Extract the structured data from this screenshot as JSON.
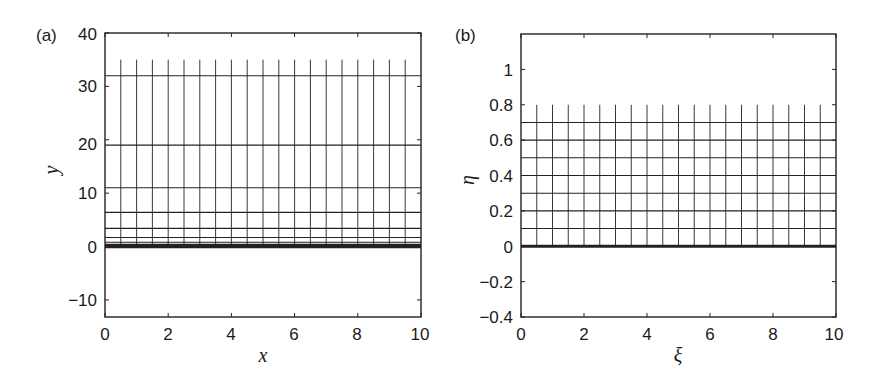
{
  "chart_data": [
    {
      "type": "line",
      "panel_label": "(a)",
      "title": "",
      "xlabel": "x",
      "ylabel": "y",
      "xlim": [
        0,
        10
      ],
      "ylim": [
        -13.2,
        40
      ],
      "xticks": [
        "0",
        "2",
        "4",
        "6",
        "8",
        "10"
      ],
      "yticks": [
        "-10",
        "0",
        "10",
        "20",
        "30",
        "40"
      ],
      "grid": false,
      "description": "Physical-plane mesh: horizontal grid lines clustered near y=0 (geometric stretching), vertical lines at x=0.5..9.5",
      "horizontal_lines_y": [
        0,
        0.4,
        0.8,
        1.7,
        3.4,
        6.4,
        11,
        19,
        32
      ],
      "thick_line_y": 0,
      "vertical_lines_x": [
        0.5,
        1.0,
        1.5,
        2.0,
        2.5,
        3.0,
        3.5,
        4.0,
        4.5,
        5.0,
        5.5,
        6.0,
        6.5,
        7.0,
        7.5,
        8.0,
        8.5,
        9.0,
        9.5
      ],
      "vertical_lines_y_range": [
        0,
        35
      ]
    },
    {
      "type": "line",
      "panel_label": "(b)",
      "title": "",
      "xlabel": "ξ",
      "ylabel": "η",
      "xlim": [
        0,
        10
      ],
      "ylim": [
        -0.4,
        1.2
      ],
      "xticks": [
        "0",
        "2",
        "4",
        "6",
        "8",
        "10"
      ],
      "yticks": [
        "-0.4",
        "-0.2",
        "0",
        "0.2",
        "0.4",
        "0.6",
        "0.8",
        "1"
      ],
      "grid": false,
      "description": "Computational-plane mesh: uniform horizontal lines at eta=0.1..0.7, vertical lines at xi=0.5..9.5",
      "horizontal_lines_y": [
        0,
        0.1,
        0.2,
        0.3,
        0.4,
        0.5,
        0.6,
        0.7
      ],
      "thick_line_y": 0,
      "vertical_lines_x": [
        0.5,
        1.0,
        1.5,
        2.0,
        2.5,
        3.0,
        3.5,
        4.0,
        4.5,
        5.0,
        5.5,
        6.0,
        6.5,
        7.0,
        7.5,
        8.0,
        8.5,
        9.0,
        9.5
      ],
      "vertical_lines_y_range": [
        0,
        0.8
      ]
    }
  ],
  "labels": {
    "a": {
      "panel": "(a)",
      "xlabel": "x",
      "ylabel": "y",
      "xticks": [
        "0",
        "2",
        "4",
        "6",
        "8",
        "10"
      ],
      "yticks": [
        "−10",
        "0",
        "10",
        "20",
        "30",
        "40"
      ]
    },
    "b": {
      "panel": "(b)",
      "xlabel": "ξ",
      "ylabel": "η",
      "xticks": [
        "0",
        "2",
        "4",
        "6",
        "8",
        "10"
      ],
      "yticks": [
        "−0.4",
        "−0.2",
        "0",
        "0.2",
        "0.4",
        "0.6",
        "0.8",
        "1"
      ]
    }
  }
}
